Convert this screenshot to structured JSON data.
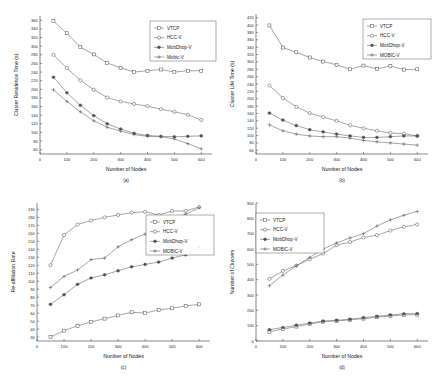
{
  "figure": {
    "background": "#ffffff",
    "line_color": "#6f6f6f",
    "axis_color": "#3a3a3a"
  },
  "series_styles": {
    "VTCP": "square-open",
    "HCC-V": "circle-open",
    "MobDhop-V": "star-solid",
    "Mobic-V": "plus",
    "MOBIC-V": "plus"
  },
  "chart_data": [
    {
      "id": "a",
      "type": "line",
      "caption": "(a)",
      "title": "",
      "xlabel": "Number of Nodes",
      "ylabel": "Cluster Residence Time (s)",
      "x": [
        50,
        100,
        150,
        200,
        250,
        300,
        350,
        400,
        450,
        500,
        550,
        600
      ],
      "xlim": [
        0,
        640
      ],
      "ylim": [
        50,
        370
      ],
      "xticks": [
        0,
        100,
        200,
        300,
        400,
        500,
        600
      ],
      "yticks": [
        60,
        80,
        100,
        120,
        140,
        160,
        180,
        200,
        220,
        240,
        260,
        280,
        300,
        320,
        340,
        360
      ],
      "grid": false,
      "legend_position": "top-right",
      "series": [
        {
          "name": "VTCP",
          "values": [
            358,
            330,
            298,
            281,
            261,
            250,
            240,
            243,
            246,
            240,
            243,
            243
          ]
        },
        {
          "name": "HCC-V",
          "values": [
            280,
            249,
            221,
            199,
            181,
            172,
            166,
            161,
            154,
            148,
            141,
            129
          ]
        },
        {
          "name": "MobDhop-V",
          "values": [
            228,
            192,
            163,
            139,
            120,
            108,
            98,
            93,
            91,
            90,
            91,
            92
          ]
        },
        {
          "name": "Mobic-V",
          "values": [
            199,
            172,
            148,
            127,
            112,
            103,
            95,
            91,
            90,
            85,
            74,
            62
          ]
        }
      ]
    },
    {
      "id": "b",
      "type": "line",
      "caption": "(b)",
      "title": "",
      "xlabel": "Number of Nodes",
      "ylabel": "Cluster Life Time (s)",
      "x": [
        50,
        100,
        150,
        200,
        250,
        300,
        350,
        400,
        450,
        500,
        550,
        600
      ],
      "xlim": [
        0,
        640
      ],
      "ylim": [
        50,
        430
      ],
      "xticks": [
        0,
        100,
        200,
        300,
        400,
        500,
        600
      ],
      "yticks": [
        60,
        80,
        100,
        120,
        140,
        160,
        180,
        200,
        220,
        240,
        260,
        280,
        300,
        320,
        340,
        360,
        380,
        400,
        420
      ],
      "grid": false,
      "legend_position": "top-right",
      "series": [
        {
          "name": "VTCP",
          "values": [
            399,
            339,
            326,
            312,
            301,
            292,
            280,
            290,
            281,
            289,
            279,
            280
          ]
        },
        {
          "name": "HCC-V",
          "values": [
            236,
            202,
            178,
            161,
            150,
            140,
            128,
            120,
            113,
            107,
            105,
            99
          ]
        },
        {
          "name": "MobDhop-V",
          "values": [
            161,
            142,
            127,
            116,
            110,
            104,
            99,
            95,
            95,
            97,
            99,
            99
          ]
        },
        {
          "name": "MOBIC-V",
          "values": [
            129,
            113,
            104,
            99,
            97,
            97,
            93,
            87,
            83,
            80,
            77,
            74
          ]
        }
      ]
    },
    {
      "id": "c",
      "type": "line",
      "caption": "(c)",
      "title": "",
      "xlabel": "Number of Nodes",
      "ylabel": "Re-affiliation Rate",
      "x": [
        50,
        100,
        150,
        200,
        250,
        300,
        350,
        400,
        450,
        500,
        550,
        600
      ],
      "xlim": [
        0,
        640
      ],
      "ylim": [
        25,
        198
      ],
      "xticks": [
        0,
        100,
        200,
        300,
        400,
        500,
        600
      ],
      "yticks": [
        30,
        40,
        50,
        60,
        70,
        80,
        90,
        100,
        110,
        120,
        130,
        140,
        150,
        160,
        170,
        180,
        190
      ],
      "grid": false,
      "legend_position": "right",
      "series": [
        {
          "name": "VTCP",
          "values": [
            30,
            38,
            44,
            49,
            53,
            57,
            61,
            60,
            64,
            66,
            69,
            71
          ]
        },
        {
          "name": "HCC-V",
          "values": [
            120,
            158,
            171,
            176,
            180,
            183,
            186,
            187,
            183,
            188,
            188,
            193
          ]
        },
        {
          "name": "MobDhop-V",
          "values": [
            71,
            83,
            96,
            104,
            108,
            113,
            118,
            121,
            124,
            129,
            133,
            143
          ]
        },
        {
          "name": "MOBIC-V",
          "values": [
            92,
            106,
            114,
            127,
            129,
            143,
            152,
            159,
            167,
            177,
            184,
            192
          ]
        }
      ]
    },
    {
      "id": "d",
      "type": "line",
      "caption": "(d)",
      "title": "",
      "xlabel": "Number of Nodes",
      "ylabel": "Number of Clusters",
      "x": [
        50,
        100,
        150,
        200,
        250,
        300,
        350,
        400,
        450,
        500,
        550,
        600
      ],
      "xlim": [
        0,
        640
      ],
      "ylim": [
        0,
        900
      ],
      "xticks": [
        0,
        100,
        200,
        300,
        400,
        500,
        600
      ],
      "yticks": [
        0,
        100,
        200,
        300,
        400,
        500,
        600,
        700,
        800,
        900
      ],
      "grid": false,
      "legend_position": "top-left",
      "series": [
        {
          "name": "VTCP",
          "values": [
            60,
            78,
            94,
            110,
            126,
            131,
            138,
            146,
            155,
            163,
            170,
            172
          ]
        },
        {
          "name": "HCC-V",
          "values": [
            405,
            457,
            492,
            533,
            570,
            625,
            645,
            675,
            690,
            720,
            745,
            760
          ]
        },
        {
          "name": "MobDhop-V",
          "values": [
            74,
            88,
            103,
            117,
            130,
            135,
            142,
            152,
            161,
            170,
            177,
            179
          ]
        },
        {
          "name": "MOBIC-V",
          "values": [
            360,
            430,
            490,
            545,
            600,
            640,
            672,
            700,
            750,
            790,
            820,
            845
          ]
        }
      ]
    }
  ]
}
